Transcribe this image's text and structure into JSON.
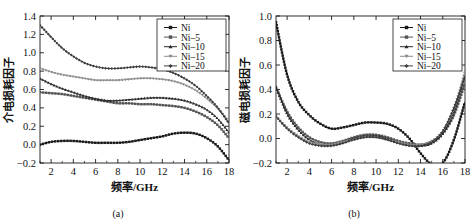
{
  "figure": {
    "panels": [
      {
        "caption": "(a)",
        "xlabel": "频率/GHz",
        "ylabel": "介电损耗因子",
        "xticks": [
          "2",
          "4",
          "6",
          "8",
          "10",
          "12",
          "14",
          "16",
          "18"
        ],
        "yticks": [
          "-0.2",
          "0.0",
          "0.2",
          "0.4",
          "0.6",
          "0.8",
          "1.0",
          "1.2",
          "1.4"
        ]
      },
      {
        "caption": "(b)",
        "xlabel": "频率/GHz",
        "ylabel": "磁电损耗因子",
        "xticks": [
          "2",
          "4",
          "6",
          "8",
          "10",
          "12",
          "14",
          "16",
          "18"
        ],
        "yticks": [
          "-0.2",
          "0.0",
          "0.2",
          "0.4",
          "0.6",
          "0.8",
          "1.0"
        ]
      }
    ],
    "legend": [
      {
        "label": "Ni",
        "color": "#1a1a1a",
        "marker": "square"
      },
      {
        "label": "Ni-5",
        "color": "#555555",
        "marker": "square"
      },
      {
        "label": "Ni-10",
        "color": "#2b2b2b",
        "marker": "triangle"
      },
      {
        "label": "Ni-15",
        "color": "#8d8d8d",
        "marker": "triangle-down"
      },
      {
        "label": "Ni-20",
        "color": "#3d3d3d",
        "marker": "diamond"
      }
    ]
  },
  "chart_data": [
    {
      "type": "line",
      "title": "",
      "panel": "(a)",
      "xlabel": "频率/GHz",
      "ylabel": "介电损耗因子",
      "xlim": [
        1,
        18
      ],
      "ylim": [
        -0.2,
        1.4
      ],
      "xticks": [
        2,
        4,
        6,
        8,
        10,
        12,
        14,
        16,
        18
      ],
      "yticks": [
        -0.2,
        0.0,
        0.2,
        0.4,
        0.6,
        0.8,
        1.0,
        1.2,
        1.4
      ],
      "grid": false,
      "legend_position": "top-right",
      "x": [
        1,
        2,
        3,
        4,
        5,
        6,
        7,
        8,
        9,
        10,
        11,
        12,
        13,
        14,
        15,
        16,
        17,
        18
      ],
      "series": [
        {
          "name": "Ni",
          "values": [
            0.0,
            0.03,
            0.04,
            0.04,
            0.03,
            0.02,
            0.02,
            0.02,
            0.03,
            0.05,
            0.07,
            0.09,
            0.12,
            0.13,
            0.12,
            0.07,
            -0.02,
            -0.17
          ]
        },
        {
          "name": "Ni-5",
          "values": [
            0.57,
            0.56,
            0.55,
            0.53,
            0.51,
            0.49,
            0.47,
            0.45,
            0.45,
            0.44,
            0.44,
            0.43,
            0.42,
            0.4,
            0.36,
            0.3,
            0.21,
            0.07
          ]
        },
        {
          "name": "Ni-10",
          "values": [
            0.72,
            0.66,
            0.61,
            0.57,
            0.53,
            0.5,
            0.48,
            0.48,
            0.49,
            0.5,
            0.51,
            0.51,
            0.5,
            0.48,
            0.44,
            0.38,
            0.28,
            0.13
          ]
        },
        {
          "name": "Ni-15",
          "values": [
            0.83,
            0.79,
            0.76,
            0.74,
            0.72,
            0.7,
            0.7,
            0.7,
            0.71,
            0.72,
            0.72,
            0.71,
            0.69,
            0.65,
            0.59,
            0.5,
            0.39,
            0.25
          ]
        },
        {
          "name": "Ni-20",
          "values": [
            1.3,
            1.17,
            1.05,
            0.96,
            0.89,
            0.85,
            0.83,
            0.83,
            0.84,
            0.85,
            0.84,
            0.82,
            0.78,
            0.72,
            0.64,
            0.53,
            0.4,
            0.23
          ]
        }
      ]
    },
    {
      "type": "line",
      "title": "",
      "panel": "(b)",
      "xlabel": "频率/GHz",
      "ylabel": "磁电损耗因子",
      "xlim": [
        1,
        18
      ],
      "ylim": [
        -0.2,
        1.0
      ],
      "xticks": [
        2,
        4,
        6,
        8,
        10,
        12,
        14,
        16,
        18
      ],
      "yticks": [
        -0.2,
        0.0,
        0.2,
        0.4,
        0.6,
        0.8,
        1.0
      ],
      "grid": false,
      "legend_position": "top-right",
      "x": [
        1,
        2,
        3,
        4,
        5,
        6,
        7,
        8,
        9,
        10,
        11,
        12,
        13,
        14,
        15,
        16,
        17,
        18
      ],
      "series": [
        {
          "name": "Ni",
          "values": [
            0.95,
            0.52,
            0.3,
            0.19,
            0.12,
            0.08,
            0.09,
            0.11,
            0.13,
            0.13,
            0.12,
            0.08,
            0.0,
            -0.12,
            -0.21,
            -0.2,
            -0.01,
            0.3
          ]
        },
        {
          "name": "Ni-5",
          "values": [
            0.42,
            0.22,
            0.09,
            0.01,
            -0.03,
            -0.04,
            -0.02,
            0.01,
            0.03,
            0.03,
            0.01,
            -0.02,
            -0.04,
            -0.05,
            -0.03,
            0.04,
            0.19,
            0.45
          ]
        },
        {
          "name": "Ni-10",
          "values": [
            0.42,
            0.2,
            0.07,
            -0.01,
            -0.05,
            -0.05,
            -0.03,
            0.0,
            0.02,
            0.02,
            0.0,
            -0.03,
            -0.05,
            -0.06,
            -0.04,
            0.04,
            0.22,
            0.52
          ]
        },
        {
          "name": "Ni-15",
          "values": [
            0.18,
            0.09,
            0.02,
            -0.03,
            -0.05,
            -0.05,
            -0.03,
            -0.01,
            0.01,
            0.01,
            -0.01,
            -0.03,
            -0.05,
            -0.05,
            -0.02,
            0.06,
            0.24,
            0.55
          ]
        },
        {
          "name": "Ni-20",
          "values": [
            0.18,
            0.08,
            0.01,
            -0.04,
            -0.06,
            -0.06,
            -0.04,
            -0.01,
            0.01,
            0.01,
            -0.01,
            -0.04,
            -0.06,
            -0.06,
            -0.03,
            0.06,
            0.25,
            0.5
          ]
        }
      ]
    }
  ]
}
